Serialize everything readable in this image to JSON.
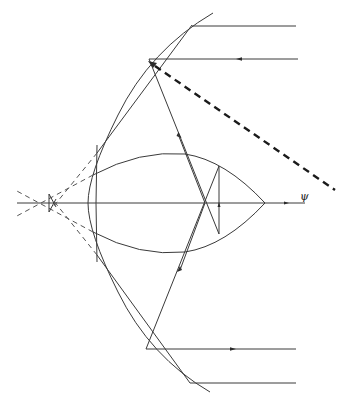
{
  "figure": {
    "type": "optics ray diagram",
    "axis_label": "ψ",
    "elements": [
      "outer curved mirror arc",
      "inner chord surfaces",
      "lens-shaped (eye-shaped) region along axis",
      "incoming parallel rays (top and bottom)",
      "reflected rays crossing on axis",
      "thick dashed incident ray",
      "dashed extension lines converging left of mirror"
    ],
    "colors": {
      "line": "#3a3a3a",
      "background": "#ffffff"
    }
  }
}
